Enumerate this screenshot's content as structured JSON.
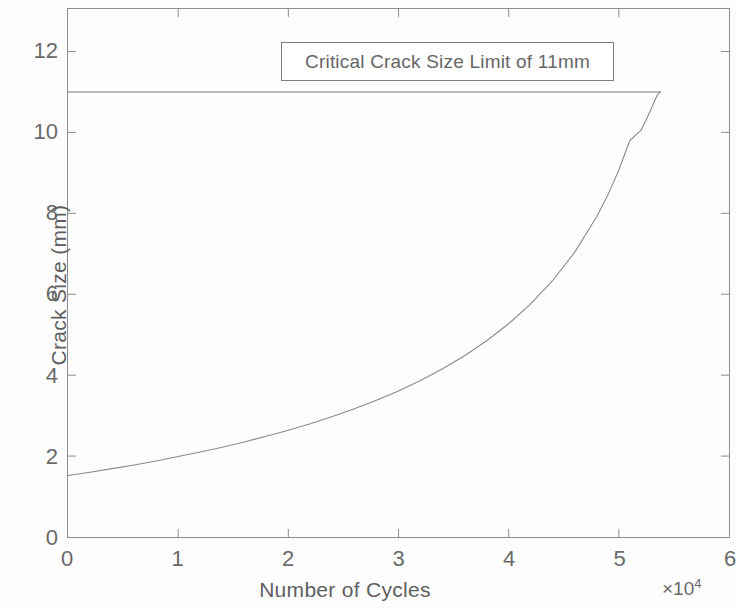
{
  "chart_data": {
    "type": "line",
    "title": "",
    "xlabel": "Number of Cycles",
    "ylabel": "Crack Size (mm)",
    "x_exponent_prefix": "×10",
    "x_exponent_power": "4",
    "x_exponent_label": "×10⁴",
    "xlim": [
      0,
      60000
    ],
    "ylim": [
      0,
      13.05
    ],
    "xticks": [
      0,
      10000,
      20000,
      30000,
      40000,
      50000,
      60000
    ],
    "xticklabels": [
      "0",
      "1",
      "2",
      "3",
      "4",
      "5",
      "6"
    ],
    "yticks": [
      0,
      2,
      4,
      6,
      8,
      10,
      12
    ],
    "yticklabels": [
      "0",
      "2",
      "4",
      "6",
      "8",
      "10",
      "12"
    ],
    "grid": false,
    "legend_position": "top-center",
    "series": [
      {
        "name": "Crack Growth",
        "color": "#8a8a8a",
        "linewidth": 1,
        "x": [
          0,
          2000,
          4000,
          6000,
          8000,
          10000,
          12000,
          14000,
          16000,
          18000,
          20000,
          22000,
          24000,
          26000,
          28000,
          30000,
          32000,
          34000,
          36000,
          38000,
          40000,
          42000,
          44000,
          46000,
          48000,
          49000,
          50000,
          51000,
          52000,
          52500,
          53000,
          53300,
          53500,
          53700,
          53800
        ],
        "y": [
          1.52,
          1.6,
          1.69,
          1.78,
          1.88,
          1.99,
          2.1,
          2.22,
          2.35,
          2.49,
          2.64,
          2.8,
          2.98,
          3.17,
          3.38,
          3.61,
          3.87,
          4.16,
          4.48,
          4.85,
          5.27,
          5.76,
          6.34,
          7.04,
          7.92,
          8.45,
          9.07,
          9.8,
          10.05,
          10.32,
          10.62,
          10.82,
          10.92,
          10.99,
          11.0
        ]
      },
      {
        "name": "Critical Crack Size Limit of 11mm",
        "color": "#7a7a7a",
        "linewidth": 1,
        "type": "horizontal-line",
        "value": 11.0,
        "x_start": 0,
        "x_end": 53800
      }
    ],
    "annotations": [
      {
        "kind": "legend-text-box",
        "text": "Critical Crack Size Limit of 11mm"
      }
    ]
  },
  "legend": {
    "label": "Critical Crack Size Limit of 11mm"
  },
  "axes": {
    "x_title": "Number of Cycles",
    "y_title": "Crack Size (mm)",
    "x_exponent_base": "×10",
    "x_exponent_power": "4"
  },
  "colors": {
    "axis": "#8c8c8c",
    "curve": "#8a8a8a",
    "limit_line": "#7a7a7a",
    "text": "#6a6a6a",
    "background": "#fdfdfd"
  }
}
